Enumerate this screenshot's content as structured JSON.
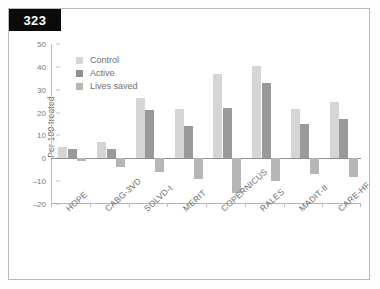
{
  "page": {
    "number": "323"
  },
  "chart_data": {
    "type": "bar",
    "title": "",
    "xlabel": "",
    "ylabel": "Per 100 treated",
    "ylim": [
      -20,
      50
    ],
    "yticks": [
      50,
      40,
      30,
      20,
      10,
      0,
      -10,
      -20
    ],
    "ytick_labels": [
      "50",
      "40",
      "30",
      "20",
      "10",
      "0",
      "–10",
      "–20"
    ],
    "grid": false,
    "legend_position": "top-left",
    "categories": [
      "HOPE",
      "CABG-3VD",
      "SOLVD-t",
      "MERIT",
      "COPERNICUS",
      "RALES",
      "MADIT-II",
      "CARE-HF"
    ],
    "series": [
      {
        "name": "Control",
        "color": "#d5d5d5",
        "values": [
          5,
          7,
          26.5,
          21.5,
          37,
          40.5,
          21.5,
          24.5
        ]
      },
      {
        "name": "Active",
        "color": "#9a9a9a",
        "values": [
          4,
          4,
          21,
          14,
          22,
          33,
          15,
          17
        ]
      },
      {
        "name": "Lives saved",
        "color": "#b6b6b6",
        "values": [
          -1,
          -4,
          -6,
          -9,
          -15,
          -10,
          -7,
          -8
        ]
      }
    ]
  }
}
